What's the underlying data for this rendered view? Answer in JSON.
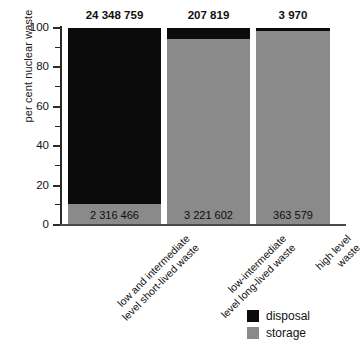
{
  "chart_data": {
    "type": "bar",
    "title": "",
    "xlabel": "",
    "ylabel": "per cent nuclear waste",
    "ylim": [
      0,
      100
    ],
    "ytick_labels": [
      "0",
      "20",
      "40",
      "60",
      "80",
      "100"
    ],
    "ytick_values": [
      0,
      20,
      40,
      60,
      80,
      100
    ],
    "minor_ticks": [
      10,
      30,
      50,
      70,
      90
    ],
    "grid": false,
    "stacked": true,
    "legend_position": "bottom-right",
    "categories": [
      "low and intermediate level short-lived waste",
      "low-intermediate level long-lived waste",
      "high level waste"
    ],
    "series": [
      {
        "name": "disposal",
        "color": "#0b0b0b",
        "values": [
          90.0,
          5.5,
          1.5
        ]
      },
      {
        "name": "storage",
        "color": "#8a8a8a",
        "values": [
          10.0,
          94.5,
          98.5
        ]
      }
    ],
    "bar_top_labels": [
      "24 348 759",
      "207 819",
      "3 970"
    ],
    "bar_inner_labels": [
      "2 316 466",
      "3 221 602",
      "363 579"
    ],
    "annotations": {
      "top_label_meaning": "disposal amount per category",
      "inner_label_meaning": "storage amount per category"
    }
  },
  "axis": {
    "y_title": "per cent nuclear waste",
    "tick_100": "100",
    "tick_80": "80",
    "tick_60": "60",
    "tick_40": "40",
    "tick_20": "20",
    "tick_0": "0"
  },
  "bars": [
    {
      "top_label": "24 348 759",
      "inner_label": "2 316 466",
      "cat_line1": "low and intermediate",
      "cat_line2": "level short-lived waste"
    },
    {
      "top_label": "207 819",
      "inner_label": "3 221 602",
      "cat_line1": "low-intermediate",
      "cat_line2": "level long-lived waste"
    },
    {
      "top_label": "3 970",
      "inner_label": "363 579",
      "cat_line1": "high level",
      "cat_line2": "waste"
    }
  ],
  "legend": {
    "disposal_label": "disposal",
    "storage_label": "storage"
  },
  "colors": {
    "disposal": "#0b0b0b",
    "storage": "#8a8a8a",
    "axis": "#2a2a2a",
    "text": "#111111",
    "background": "#ffffff"
  }
}
